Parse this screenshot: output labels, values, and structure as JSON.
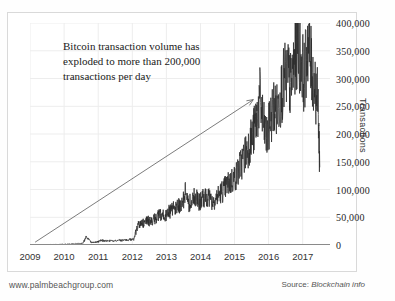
{
  "annotation": {
    "line1": "Bitcoin transaction volume has",
    "line2": "exploded to more than 200,000",
    "line3": "transactions per day"
  },
  "footer": {
    "website": "www.palmbeachgroup.com",
    "source_prefix": "Source:",
    "source_name": "Blockchain info"
  },
  "colors": {
    "series": "#2b2b2b",
    "grid": "#ededed",
    "axis": "#8a8a8a",
    "frame": "#d9d9d9",
    "text": "#262626",
    "arrow": "#5a5a5a"
  },
  "chart_data": {
    "type": "line",
    "title": "",
    "subtitle": "",
    "xlabel": "",
    "ylabel": "Transactions",
    "xlim": [
      2009,
      2017.8
    ],
    "ylim": [
      0,
      400000
    ],
    "grid": true,
    "legend": false,
    "y_ticks": [
      0,
      50000,
      100000,
      150000,
      200000,
      250000,
      300000,
      350000,
      400000
    ],
    "y_ticklabels": [
      "0",
      "50,000",
      "100,000",
      "150,000",
      "200,000",
      "250,000",
      "300,000",
      "350,000",
      "400,000"
    ],
    "x_ticks": [
      2009,
      2010,
      2011,
      2012,
      2013,
      2014,
      2015,
      2016,
      2017
    ],
    "x_ticklabels": [
      "2009",
      "2010",
      "2011",
      "2012",
      "2013",
      "2014",
      "2015",
      "2016",
      "2017"
    ],
    "annotations": [
      {
        "text": "Bitcoin transaction volume has exploded to more than 200,000 transactions per day",
        "type": "text-with-arrow",
        "arrow_from": [
          2009.15,
          5000
        ],
        "arrow_to": [
          2015.55,
          262000
        ]
      }
    ],
    "series": [
      {
        "name": "Bitcoin transactions per day",
        "x": [
          2009.0,
          2009.25,
          2009.5,
          2009.75,
          2010.0,
          2010.2,
          2010.4,
          2010.55,
          2010.65,
          2010.8,
          2010.9,
          2011.0,
          2011.1,
          2011.2,
          2011.35,
          2011.5,
          2011.65,
          2011.8,
          2011.95,
          2012.05,
          2012.15,
          2012.25,
          2012.35,
          2012.45,
          2012.55,
          2012.65,
          2012.75,
          2012.85,
          2012.95,
          2013.05,
          2013.15,
          2013.25,
          2013.35,
          2013.45,
          2013.55,
          2013.65,
          2013.75,
          2013.85,
          2013.95,
          2014.05,
          2014.15,
          2014.25,
          2014.35,
          2014.45,
          2014.55,
          2014.65,
          2014.75,
          2014.85,
          2014.95,
          2015.05,
          2015.15,
          2015.25,
          2015.35,
          2015.45,
          2015.55,
          2015.65,
          2015.75,
          2015.85,
          2015.95,
          2016.05,
          2016.15,
          2016.25,
          2016.35,
          2016.45,
          2016.55,
          2016.65,
          2016.75,
          2016.85,
          2016.95,
          2017.05,
          2017.15,
          2017.25,
          2017.35,
          2017.45,
          2017.5
        ],
        "values": [
          100,
          200,
          400,
          700,
          1200,
          1800,
          2500,
          3200,
          14000,
          4500,
          5200,
          6000,
          8500,
          7000,
          7500,
          8000,
          8500,
          9000,
          9500,
          10500,
          34000,
          42000,
          38000,
          45000,
          40000,
          47000,
          52000,
          55000,
          50000,
          58000,
          62000,
          66000,
          70000,
          68000,
          96000,
          72000,
          80000,
          88000,
          76000,
          82000,
          90000,
          86000,
          78000,
          84000,
          92000,
          98000,
          105000,
          112000,
          118000,
          125000,
          140000,
          155000,
          170000,
          185000,
          200000,
          230000,
          265000,
          215000,
          190000,
          225000,
          250000,
          240000,
          270000,
          295000,
          310000,
          285000,
          330000,
          360000,
          340000,
          300000,
          370000,
          320000,
          290000,
          255000,
          140000
        ],
        "color": "#2b2b2b"
      }
    ]
  }
}
